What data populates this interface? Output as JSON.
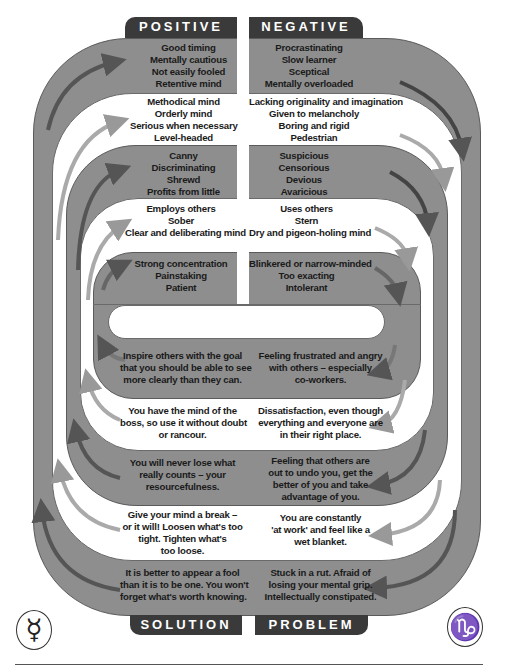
{
  "tabs": {
    "top_left": "POSITIVE",
    "top_right": "NEGATIVE",
    "bottom_left": "SOLUTION",
    "bottom_right": "PROBLEM"
  },
  "top": {
    "positive": [
      [
        "Good timing",
        "Mentally cautious",
        "Not easily fooled",
        "Retentive mind"
      ],
      [
        "Methodical mind",
        "Orderly mind",
        "Serious when necessary",
        "Level-headed"
      ],
      [
        "Canny",
        "Discriminating",
        "Shrewd",
        "Profits from little"
      ],
      [
        "Employs others",
        "Sober",
        "Clear and deliberating mind"
      ],
      [
        "Strong concentration",
        "Painstaking",
        "Patient"
      ]
    ],
    "negative": [
      [
        "Procrastinating",
        "Slow learner",
        "Sceptical",
        "Mentally overloaded"
      ],
      [
        "Lacking originality and imagination",
        "Given to melancholy",
        "Boring and rigid",
        "Pedestrian"
      ],
      [
        "Suspicious",
        "Censorious",
        "Devious",
        "Avaricious"
      ],
      [
        "Uses others",
        "Stern",
        "Dry and pigeon-holing mind"
      ],
      [
        "Blinkered or narrow-minded",
        "Too exacting",
        "Intolerant"
      ]
    ]
  },
  "bottom": {
    "solution": [
      [
        "Inspire others with the goal",
        "that you should be able to see",
        "more clearly than they can."
      ],
      [
        "You have the mind of the",
        "boss, so use it without doubt",
        "or rancour."
      ],
      [
        "You will never lose what",
        "really counts – your",
        "resourcefulness."
      ],
      [
        "Give your mind a break –",
        "or it will! Loosen what's too",
        "tight. Tighten what's",
        "too loose."
      ],
      [
        "It is better to appear a fool",
        "than it is to be one. You won't",
        "forget what's worth knowing."
      ]
    ],
    "problem": [
      [
        "Feeling frustrated and angry",
        "with others – especially",
        "co-workers."
      ],
      [
        "Dissatisfaction, even though",
        "everything and everyone are",
        "in their right place."
      ],
      [
        "Feeling that others are",
        "out to undo you, get the",
        "better of you and take",
        "advantage of you."
      ],
      [
        "You are constantly",
        "'at work' and feel like a",
        "wet blanket."
      ],
      [
        "Stuck in a rut. Afraid of",
        "losing your mental grip.",
        "Intellectually constipated."
      ]
    ]
  },
  "symbols": {
    "left": "☿",
    "right": "♑"
  },
  "colors": {
    "band_gray": "#8e8e8e",
    "tab_dark": "#3a3a3a",
    "arrow_dark": "#555555",
    "arrow_light": "#b5b5b5"
  }
}
